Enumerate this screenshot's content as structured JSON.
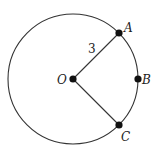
{
  "diagram": {
    "type": "circle-with-radii",
    "circle": {
      "cx": 73,
      "cy": 79,
      "r": 65,
      "stroke": "#333333"
    },
    "center": {
      "label": "O",
      "x": 73,
      "y": 79
    },
    "points": [
      {
        "label": "A",
        "x": 119,
        "y": 33
      },
      {
        "label": "B",
        "x": 138,
        "y": 79
      },
      {
        "label": "C",
        "x": 119,
        "y": 125
      }
    ],
    "segments": [
      {
        "from": "O",
        "to": "A",
        "label": "3"
      },
      {
        "from": "O",
        "to": "C",
        "label": ""
      }
    ],
    "radius_label": "3",
    "colors": {
      "stroke": "#333333",
      "point": "#111111",
      "text": "#222222"
    }
  }
}
